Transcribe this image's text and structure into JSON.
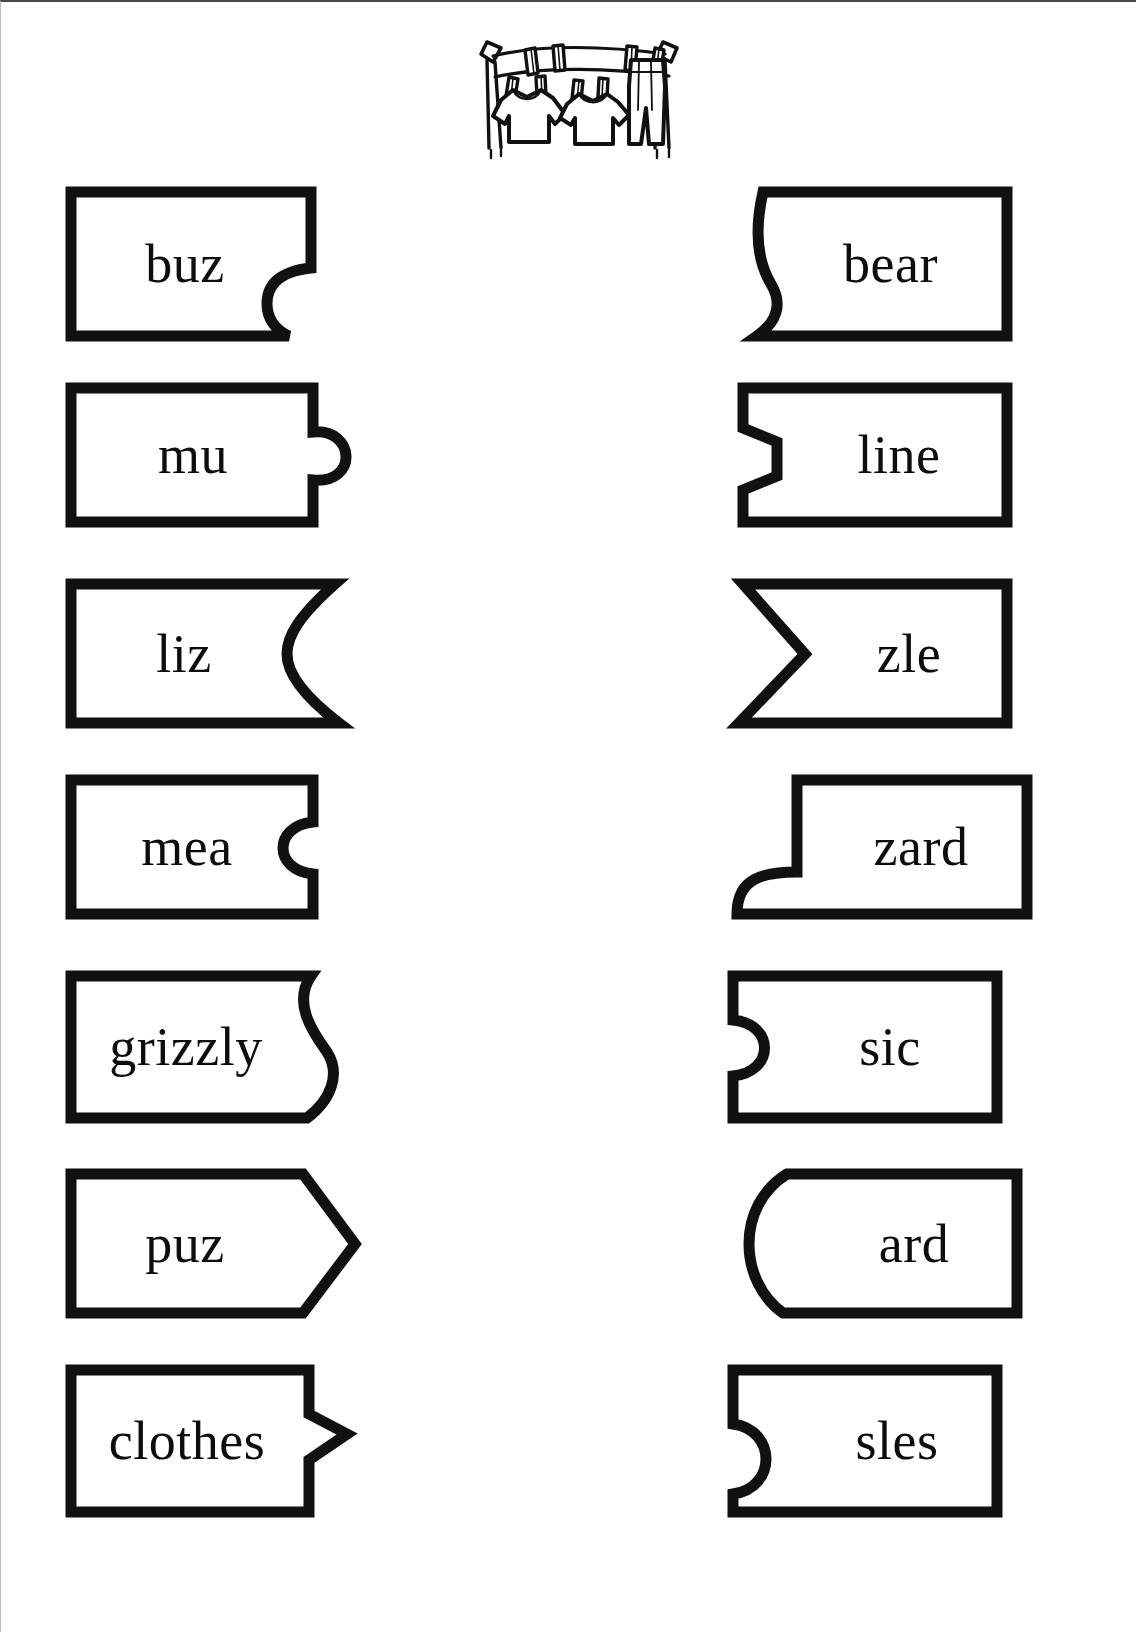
{
  "page": {
    "background_color": "#ffffff",
    "ink_color": "#111111",
    "border_color": "#4a4a4a"
  },
  "clipart": {
    "name": "clothesline-with-laundry",
    "description": "Clothesline strung between two posts with two t-shirts, a pair of pants and clothespins",
    "alt_text": "clothesline"
  },
  "worksheet": {
    "columns": [
      "left",
      "right"
    ],
    "row_count": 7,
    "rows": [
      {
        "left": {
          "text": "buz",
          "edge": "right-rounded-notch-lower",
          "shape": "notch"
        },
        "right": {
          "text": "bear",
          "edge": "left-s-curve-in",
          "shape": "s-curve"
        }
      },
      {
        "left": {
          "text": "mu",
          "edge": "right-round-tab",
          "shape": "tab"
        },
        "right": {
          "text": "line",
          "edge": "left-angular-notch",
          "shape": "zigzag"
        }
      },
      {
        "left": {
          "text": "liz",
          "edge": "right-concave-chevron",
          "shape": "chevron-in"
        },
        "right": {
          "text": "zle",
          "edge": "left-pointed-chevron",
          "shape": "chevron-point"
        }
      },
      {
        "left": {
          "text": "mea",
          "edge": "right-round-socket",
          "shape": "socket"
        },
        "right": {
          "text": "zard",
          "edge": "left-step-tab-lower",
          "shape": "step-tab"
        }
      },
      {
        "left": {
          "text": "grizzly",
          "edge": "right-s-curve-out",
          "shape": "s-curve-out"
        },
        "right": {
          "text": "sic",
          "edge": "left-round-socket",
          "shape": "socket-left"
        }
      },
      {
        "left": {
          "text": "puz",
          "edge": "right-arrow-point",
          "shape": "arrow"
        },
        "right": {
          "text": "ard",
          "edge": "left-rounded-point",
          "shape": "round-point"
        }
      },
      {
        "left": {
          "text": "clothes",
          "edge": "right-angular-tab",
          "shape": "angular-tab"
        },
        "right": {
          "text": "sles",
          "edge": "left-round-socket-lower",
          "shape": "socket-left-lower"
        }
      }
    ]
  }
}
